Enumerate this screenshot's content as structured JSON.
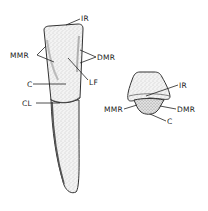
{
  "figure": {
    "left_view": {
      "name": "labial view of tooth",
      "labels": {
        "ir": "IR",
        "mmr": "MMR",
        "dmr": "DMR",
        "lf": "LF",
        "c": "C",
        "cl": "CL"
      }
    },
    "right_view": {
      "name": "incisal view of tooth",
      "labels": {
        "ir": "IR",
        "mmr": "MMR",
        "dmr": "DMR",
        "c": "C"
      }
    }
  }
}
